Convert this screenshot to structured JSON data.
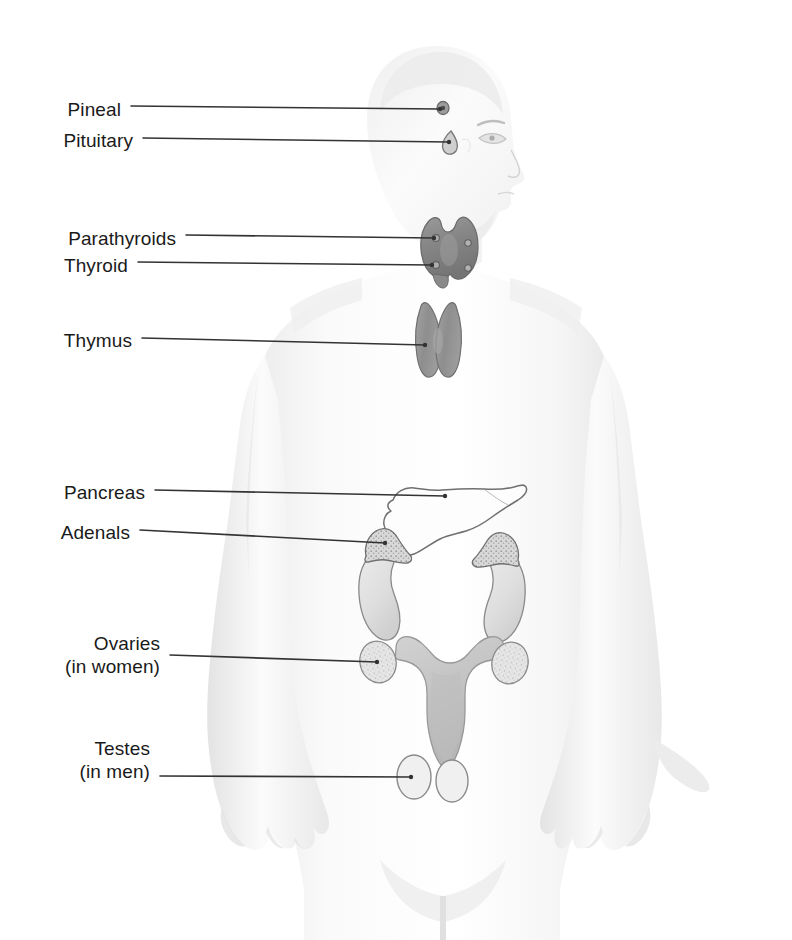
{
  "figure": {
    "background_color": "#ffffff",
    "body_silhouette_color": "#f1f1f1",
    "body_shade_color": "#e2e2e2",
    "leader_line_color": "#333333",
    "label_text_color": "#1a1a1a",
    "organ_dark_gray": "#8d8d8d",
    "organ_mid_gray": "#b4b4b4",
    "organ_light_gray": "#dcdcdc",
    "organ_outline_color": "#6f6f6f"
  },
  "labels": [
    {
      "id": "pineal",
      "name": "Pineal",
      "sub": "",
      "text_x": 60,
      "text_y": 98,
      "line_x1": 131,
      "line_y1": 106,
      "line_x2": 440,
      "line_y2": 109
    },
    {
      "id": "pituitary",
      "name": "Pituitary",
      "sub": "",
      "text_x": 60,
      "text_y": 129,
      "line_x1": 143,
      "line_y1": 138,
      "line_x2": 449,
      "line_y2": 142
    },
    {
      "id": "parathyroids",
      "name": "Parathyroids",
      "sub": "",
      "text_x": 60,
      "text_y": 227,
      "line_x1": 186,
      "line_y1": 235,
      "line_x2": 434,
      "line_y2": 238
    },
    {
      "id": "thyroid",
      "name": "Thyroid",
      "sub": "",
      "text_x": 60,
      "text_y": 254,
      "line_x1": 138,
      "line_y1": 262,
      "line_x2": 432,
      "line_y2": 265
    },
    {
      "id": "thymus",
      "name": "Thymus",
      "sub": "",
      "text_x": 60,
      "text_y": 329,
      "line_x1": 142,
      "line_y1": 338,
      "line_x2": 425,
      "line_y2": 345
    },
    {
      "id": "pancreas",
      "name": "Pancreas",
      "sub": "",
      "text_x": 60,
      "text_y": 481,
      "line_x1": 155,
      "line_y1": 490,
      "line_x2": 445,
      "line_y2": 496
    },
    {
      "id": "adenals",
      "name": "Adenals",
      "sub": "",
      "text_x": 60,
      "text_y": 521,
      "line_x1": 140,
      "line_y1": 530,
      "line_x2": 385,
      "line_y2": 543
    },
    {
      "id": "ovaries",
      "name": "Ovaries",
      "sub": "(in women)",
      "text_x": 60,
      "text_y": 632,
      "line_x1": 170,
      "line_y1": 655,
      "line_x2": 377,
      "line_y2": 662
    },
    {
      "id": "testes",
      "name": "Testes",
      "sub": "(in men)",
      "text_x": 60,
      "text_y": 737,
      "line_x1": 160,
      "line_y1": 776,
      "line_x2": 411,
      "line_y2": 777
    }
  ],
  "organs": [
    {
      "id": "pineal-gland",
      "label": "Pineal gland",
      "shape": "small-circle",
      "cx": 443,
      "cy": 108
    },
    {
      "id": "pituitary-gland",
      "label": "Pituitary gland",
      "shape": "teardrop",
      "cx": 452,
      "cy": 143
    },
    {
      "id": "thyroid-gland",
      "label": "Thyroid gland",
      "shape": "shield",
      "cx": 447,
      "cy": 248
    },
    {
      "id": "parathyroid-glands",
      "label": "Parathyroid glands",
      "shape": "dots",
      "cx": 447,
      "cy": 248
    },
    {
      "id": "thymus-gland",
      "label": "Thymus gland",
      "shape": "bowtie",
      "cx": 438,
      "cy": 340
    },
    {
      "id": "pancreas-organ",
      "label": "Pancreas",
      "shape": "outline",
      "cx": 470,
      "cy": 510
    },
    {
      "id": "adrenal-left",
      "label": "Adrenal gland",
      "shape": "stippled-cap",
      "cx": 388,
      "cy": 548
    },
    {
      "id": "adrenal-right",
      "label": "Adrenal gland",
      "shape": "stippled-cap",
      "cx": 495,
      "cy": 552
    },
    {
      "id": "kidney-left",
      "label": "Kidney",
      "shape": "bean",
      "cx": 385,
      "cy": 590
    },
    {
      "id": "kidney-right",
      "label": "Kidney",
      "shape": "bean",
      "cx": 497,
      "cy": 592
    },
    {
      "id": "uterus-organ",
      "label": "Uterus",
      "shape": "uterus",
      "cx": 443,
      "cy": 680
    },
    {
      "id": "ovary-left",
      "label": "Ovary",
      "shape": "stippled-oval",
      "cx": 378,
      "cy": 662
    },
    {
      "id": "ovary-right",
      "label": "Ovary",
      "shape": "stippled-oval",
      "cx": 508,
      "cy": 663
    },
    {
      "id": "testis-left",
      "label": "Testis",
      "shape": "oval",
      "cx": 415,
      "cy": 777
    },
    {
      "id": "testis-right",
      "label": "Testis",
      "shape": "oval",
      "cx": 452,
      "cy": 780
    }
  ],
  "body": {
    "id": "human-figure",
    "label": "Human body silhouette, front view with head in right profile",
    "orientation": "head-in-right-profile"
  }
}
